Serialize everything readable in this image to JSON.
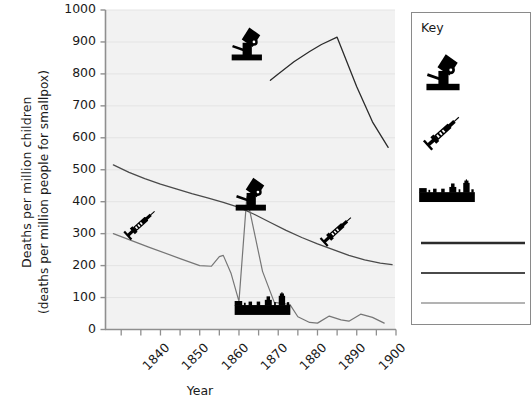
{
  "chart_data": {
    "type": "line",
    "title": "",
    "xlabel": "Year",
    "ylabel": "Deaths per million children (deaths per million people for smallpox)",
    "ylabel_line1": "Deaths per million children",
    "ylabel_line2": "(deaths per million people for smallpox)",
    "xlim": [
      1836,
      1910
    ],
    "ylim": [
      0,
      1000
    ],
    "grid": "horizontal-only",
    "xticks": [
      "1840",
      "1850",
      "1860",
      "1870",
      "1880",
      "1890",
      "1900"
    ],
    "xtick_values": [
      1840,
      1850,
      1860,
      1870,
      1880,
      1890,
      1900
    ],
    "yticks": [
      "0",
      "100",
      "200",
      "300",
      "400",
      "500",
      "600",
      "700",
      "800",
      "900",
      "1000"
    ],
    "ytick_values": [
      0,
      100,
      200,
      300,
      400,
      500,
      600,
      700,
      800,
      900,
      1000
    ],
    "legend_position": "right-outside",
    "series": [
      {
        "name": "series-top-dark",
        "color": "#2b2b2b",
        "width": 1.3,
        "points": [
          [
            1878,
            780
          ],
          [
            1880,
            800
          ],
          [
            1884,
            838
          ],
          [
            1888,
            870
          ],
          [
            1891,
            892
          ],
          [
            1895,
            915
          ],
          [
            1900,
            760
          ],
          [
            1904,
            650
          ],
          [
            1908,
            570
          ]
        ]
      },
      {
        "name": "series-middle-gray",
        "color": "#4a4a4a",
        "width": 1.3,
        "points": [
          [
            1838,
            515
          ],
          [
            1842,
            492
          ],
          [
            1846,
            472
          ],
          [
            1850,
            455
          ],
          [
            1854,
            440
          ],
          [
            1858,
            425
          ],
          [
            1862,
            412
          ],
          [
            1866,
            398
          ],
          [
            1870,
            382
          ],
          [
            1874,
            360
          ],
          [
            1878,
            335
          ],
          [
            1882,
            310
          ],
          [
            1886,
            288
          ],
          [
            1890,
            268
          ],
          [
            1894,
            250
          ],
          [
            1898,
            232
          ],
          [
            1902,
            218
          ],
          [
            1906,
            208
          ],
          [
            1909,
            203
          ]
        ]
      },
      {
        "name": "series-smallpox-light",
        "color": "#767676",
        "width": 1.2,
        "points": [
          [
            1838,
            300
          ],
          [
            1847,
            258
          ],
          [
            1855,
            222
          ],
          [
            1860,
            200
          ],
          [
            1863,
            198
          ],
          [
            1865,
            228
          ],
          [
            1866,
            232
          ],
          [
            1868,
            175
          ],
          [
            1870,
            88
          ],
          [
            1872,
            415
          ],
          [
            1876,
            182
          ],
          [
            1879,
            85
          ],
          [
            1881,
            82
          ],
          [
            1883,
            78
          ],
          [
            1885,
            40
          ],
          [
            1888,
            22
          ],
          [
            1890,
            20
          ],
          [
            1893,
            42
          ],
          [
            1896,
            30
          ],
          [
            1898,
            26
          ],
          [
            1901,
            48
          ],
          [
            1904,
            38
          ],
          [
            1907,
            20
          ]
        ]
      }
    ],
    "annotations": [
      {
        "icon": "microscope-icon",
        "x": 1872,
        "y": 900
      },
      {
        "icon": "microscope-icon",
        "x": 1873,
        "y": 430
      },
      {
        "icon": "syringe-icon",
        "x": 1845,
        "y": 330
      },
      {
        "icon": "syringe-icon",
        "x": 1895,
        "y": 310
      },
      {
        "icon": "parliament-icon",
        "x": 1876,
        "y": 80
      }
    ]
  },
  "legend": {
    "title": "Key",
    "entries": [
      {
        "icon": "microscope-icon",
        "label": ""
      },
      {
        "icon": "syringe-icon",
        "label": ""
      },
      {
        "icon": "parliament-icon",
        "label": ""
      },
      {
        "swatch": "line",
        "color": "#2b2b2b",
        "label": ""
      },
      {
        "swatch": "line",
        "color": "#4a4a4a",
        "label": ""
      },
      {
        "swatch": "line",
        "color": "#9a9a9a",
        "label": ""
      }
    ]
  }
}
